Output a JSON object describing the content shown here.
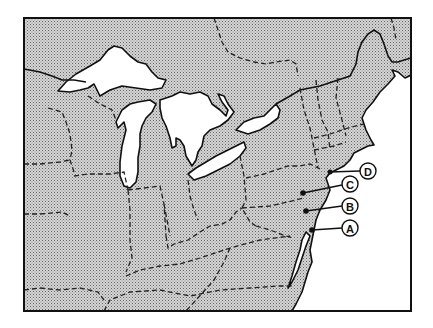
{
  "map": {
    "region": "Northeastern United States and Great Lakes",
    "frame": {
      "x": 24,
      "y": 18,
      "width": 387,
      "height": 293
    },
    "colors": {
      "land_pattern": "#9a9a9a",
      "water": "#ffffff",
      "ink": "#111111"
    },
    "markers": [
      {
        "label": "D",
        "dot": [
          330,
          172
        ],
        "circle": [
          368,
          171
        ]
      },
      {
        "label": "C",
        "dot": [
          303,
          193
        ],
        "circle": [
          350,
          184
        ]
      },
      {
        "label": "B",
        "dot": [
          306,
          211
        ],
        "circle": [
          350,
          206
        ]
      },
      {
        "label": "A",
        "dot": [
          312,
          230
        ],
        "circle": [
          350,
          228
        ]
      }
    ]
  }
}
